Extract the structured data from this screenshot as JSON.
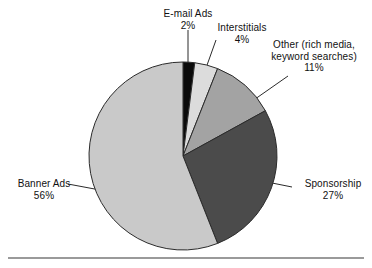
{
  "chart_data": {
    "type": "pie",
    "title": "",
    "subtitle": "",
    "xlabel": "",
    "ylabel": "",
    "legend_position": "none",
    "grid": false,
    "labels_outside": true,
    "total_percent": 100,
    "categories": [
      "E-mail Ads",
      "Interstitials",
      "Other (rich media, keyword searches)",
      "Sponsorship",
      "Banner Ads"
    ],
    "values": [
      2,
      4,
      11,
      27,
      56
    ],
    "value_labels": [
      "2%",
      "4%",
      "11%",
      "27%",
      "56%"
    ],
    "colors": [
      "#0a0a0a",
      "#dcdcdc",
      "#a3a3a3",
      "#4b4b4b",
      "#c9c9c9"
    ],
    "slices": [
      {
        "name": "E-mail Ads",
        "label_line1": "E-mail Ads",
        "label_line2": "",
        "value": 2,
        "value_label": "2%",
        "color": "#0a0a0a"
      },
      {
        "name": "Interstitials",
        "label_line1": "Interstitials",
        "label_line2": "",
        "value": 4,
        "value_label": "4%",
        "color": "#dcdcdc"
      },
      {
        "name": "Other (rich media, keyword searches)",
        "label_line1": "Other (rich media,",
        "label_line2": "keyword searches)",
        "value": 11,
        "value_label": "11%",
        "color": "#a3a3a3"
      },
      {
        "name": "Sponsorship",
        "label_line1": "Sponsorship",
        "label_line2": "",
        "value": 27,
        "value_label": "27%",
        "color": "#4b4b4b"
      },
      {
        "name": "Banner Ads",
        "label_line1": "Banner Ads",
        "label_line2": "",
        "value": 56,
        "value_label": "56%",
        "color": "#c9c9c9"
      }
    ],
    "geometry": {
      "center_x": 183,
      "center_y": 156,
      "radius": 94,
      "start_angle_deg": -90,
      "direction": "clockwise"
    },
    "rule_color": "#9a9a9a",
    "outline_color": "#2b2b2b",
    "background": "#ffffff"
  }
}
